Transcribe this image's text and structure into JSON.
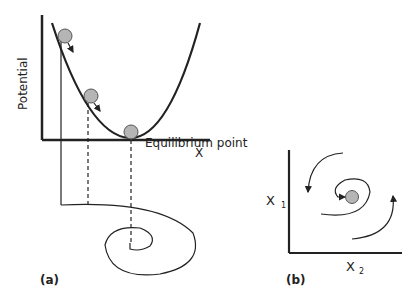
{
  "panel_a": {
    "label": "(a)",
    "y_axis_label": "Potential",
    "x_axis_label": "X",
    "equilibrium_label": "Equilibrium point"
  },
  "panel_b": {
    "label": "(b)",
    "y_axis_label": "X",
    "y_axis_sub": "1",
    "x_axis_label": "X",
    "x_axis_sub": "2"
  },
  "colors": {
    "line": "#222222",
    "ball_fill": "#b5b5b5",
    "ball_stroke": "#555555"
  }
}
